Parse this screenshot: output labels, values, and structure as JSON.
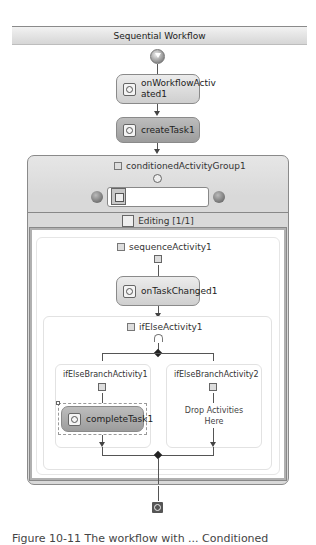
{
  "designer": {
    "title": "Sequential Workflow"
  },
  "activities": {
    "on_workflow_activated": "onWorkflowActiv\nated1",
    "on_workflow_activated_line1": "onWorkflowActiv",
    "on_workflow_activated_line2": "ated1",
    "create_task": "createTask1",
    "conditioned_group": "conditionedActivityGroup1",
    "editing_label": "Editing [1/1]",
    "sequence": "sequenceActivity1",
    "on_task_changed": "onTaskChanged1",
    "if_else": "ifElseActivity1",
    "branch1": "ifElseBranchActivity1",
    "branch2": "ifElseBranchActivity2",
    "complete_task": "completeTask1",
    "drop_hint_line1": "Drop Activities",
    "drop_hint_line2": "Here"
  },
  "icons": {
    "start": "start-circle-icon",
    "end": "end-square-icon",
    "nav_prev": "arrow-left-circle-icon",
    "nav_next": "arrow-right-circle-icon",
    "collapse": "collapse-icon"
  },
  "caption": "Figure 10-11 The workflow with ... Conditioned"
}
